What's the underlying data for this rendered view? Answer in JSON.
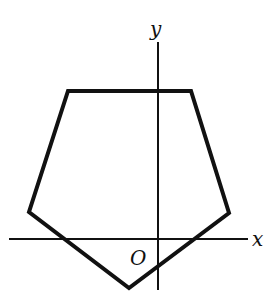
{
  "diagram": {
    "type": "coordinate-geometry",
    "axes": {
      "x_label": "x",
      "y_label": "y",
      "origin_label": "O",
      "color": "#111111"
    },
    "pentagon": {
      "stroke_color": "#111111",
      "vertices_px": [
        [
          68,
          91
        ],
        [
          191,
          91
        ],
        [
          229,
          213
        ],
        [
          129,
          288
        ],
        [
          29,
          212
        ]
      ]
    }
  }
}
